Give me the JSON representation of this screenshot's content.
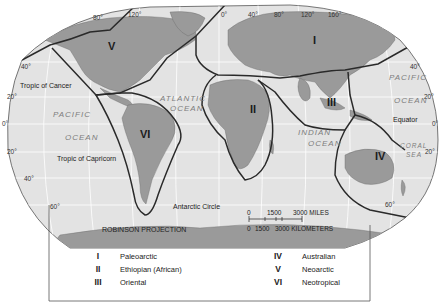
{
  "map": {
    "projection_label": "ROBINSON PROJECTION",
    "latitudes_left": [
      "40°",
      "20°",
      "0°",
      "20°",
      "40°",
      "60°"
    ],
    "latitudes_right": [
      "40°",
      "20°",
      "0°",
      "20°",
      "60°"
    ],
    "longitudes_top": [
      "80°",
      "120°",
      "0°",
      "40°",
      "80°",
      "120°",
      "160°"
    ],
    "lines": {
      "tropic_cancer": "Tropic of Cancer",
      "tropic_capricorn": "Tropic of Capricorn",
      "equator": "Equator",
      "antarctic_circle": "Antarctic Circle"
    },
    "oceans": {
      "pacific_left_1": "PACIFIC",
      "pacific_left_2": "OCEAN",
      "atlantic_1": "ATLANTIC",
      "atlantic_2": "OCEAN",
      "indian_1": "INDIAN",
      "indian_2": "OCEAN",
      "pacific_right_1": "PACIFIC",
      "pacific_right_2": "OCEAN",
      "coral_1": "CORAL",
      "coral_2": "SEA"
    },
    "realm_markers": {
      "I": "I",
      "II": "II",
      "III": "III",
      "IV": "IV",
      "V": "V",
      "VI": "VI"
    },
    "scale": {
      "miles_ticks": [
        "0",
        "1500",
        "3000 MILES"
      ],
      "km_ticks": [
        "0",
        "1500",
        "3000 KILOMETERS"
      ]
    }
  },
  "legend": {
    "items": [
      {
        "numeral": "I",
        "name": "Paleoarctic"
      },
      {
        "numeral": "II",
        "name": "Ethiopian  (African)"
      },
      {
        "numeral": "III",
        "name": "Oriental"
      },
      {
        "numeral": "IV",
        "name": "Australian"
      },
      {
        "numeral": "V",
        "name": "Neoarctic"
      },
      {
        "numeral": "VI",
        "name": "Neotropical"
      }
    ]
  },
  "colors": {
    "ocean": "#e3e3e3",
    "land": "#9a9a9a",
    "realm_border": "#2a2a2a",
    "grid": "#ffffff"
  }
}
